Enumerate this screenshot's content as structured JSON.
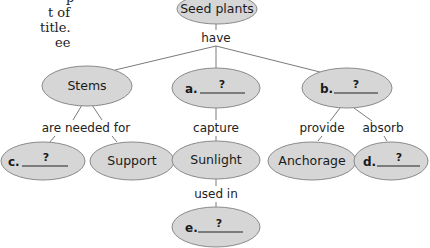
{
  "side_text": {
    "lines": [
      "p",
      "t of",
      "title.",
      "ee"
    ]
  },
  "concept_map": {
    "root": {
      "id": "seed-plants",
      "label": "Seed plants"
    },
    "root_link": "have",
    "nodes": {
      "stems": {
        "label": "Stems"
      },
      "a": {
        "letter": "a.",
        "blank": "?"
      },
      "b": {
        "letter": "b.",
        "blank": "?"
      },
      "c": {
        "letter": "c.",
        "blank": "?"
      },
      "support": {
        "label": "Support"
      },
      "sunlight": {
        "label": "Sunlight"
      },
      "anchorage": {
        "label": "Anchorage"
      },
      "d": {
        "letter": "d.",
        "blank": "?"
      },
      "e": {
        "letter": "e.",
        "blank": "?"
      }
    },
    "links": {
      "stems_to_children": "are needed for",
      "a_to_sunlight": "capture",
      "b_to_anchorage": "provide",
      "b_to_d": "absorb",
      "sunlight_to_e": "used in"
    },
    "colors": {
      "node_fill": "#d6d6d6",
      "node_stroke": "#8a8a8a",
      "edge": "#7a7a7a",
      "text": "#1a1a1a"
    }
  }
}
